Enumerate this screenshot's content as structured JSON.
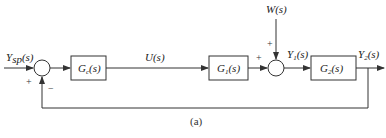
{
  "diagram": {
    "type": "block-diagram",
    "caption": "(a)",
    "colors": {
      "line": "#333333",
      "background": "#ffffff"
    },
    "signals": {
      "reference": {
        "main": "Y",
        "sub": "sp",
        "arg": "(s)"
      },
      "control": {
        "main": "U",
        "sub": "",
        "arg": "(s)"
      },
      "disturbance": {
        "main": "W",
        "sub": "",
        "arg": "(s)"
      },
      "intermediate": {
        "main": "Y",
        "sub": "1",
        "arg": "(s)"
      },
      "output": {
        "main": "Y",
        "sub": "2",
        "arg": "(s)"
      }
    },
    "blocks": [
      {
        "id": "controller",
        "main": "G",
        "sub": "c",
        "arg": "(s)"
      },
      {
        "id": "process1",
        "main": "G",
        "sub": "1",
        "arg": "(s)"
      },
      {
        "id": "process2",
        "main": "G",
        "sub": "2",
        "arg": "(s)"
      }
    ],
    "summing_junctions": [
      {
        "id": "error-junction",
        "signs": {
          "left": "+",
          "bottom": "−"
        }
      },
      {
        "id": "disturbance-junction",
        "signs": {
          "left": "+",
          "top": "+"
        }
      }
    ]
  }
}
